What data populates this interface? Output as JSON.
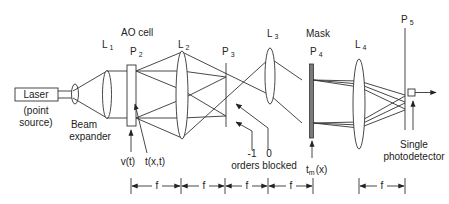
{
  "diagram": {
    "type": "optical-correlator-schematic",
    "colors": {
      "line": "#333333",
      "mask_fill": "#7a7a7a",
      "background": "#ffffff"
    },
    "laser": {
      "label": "Laser",
      "sublabel_line1": "(point",
      "sublabel_line2": "source)"
    },
    "beam_expander": {
      "label_line1": "Beam",
      "label_line2": "expander"
    },
    "lenses": [
      {
        "id": "L1",
        "main": "L",
        "sub": "1"
      },
      {
        "id": "L2",
        "main": "L",
        "sub": "2"
      },
      {
        "id": "L3",
        "main": "L",
        "sub": "3"
      },
      {
        "id": "L4",
        "main": "L",
        "sub": "4"
      }
    ],
    "planes": [
      {
        "id": "P2",
        "main": "P",
        "sub": "2"
      },
      {
        "id": "P3",
        "main": "P",
        "sub": "3"
      },
      {
        "id": "P4",
        "main": "P",
        "sub": "4"
      },
      {
        "id": "P5",
        "main": "P",
        "sub": "5"
      }
    ],
    "ao_cell": {
      "label": "AO cell",
      "input_signal": "v(t)",
      "transmittance": "t(x,t)"
    },
    "orders": {
      "minus_one": "-1",
      "zero": "0",
      "caption": "orders blocked"
    },
    "mask": {
      "label": "Mask",
      "function_main": "t",
      "function_sub": "m",
      "function_arg": "(x)"
    },
    "detector": {
      "label_line1": "Single",
      "label_line2": "photodetector"
    },
    "spacing": {
      "label": "f",
      "count_left": 4,
      "count_right": 1
    }
  }
}
